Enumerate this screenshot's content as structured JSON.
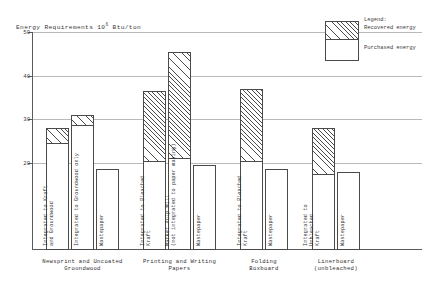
{
  "chart_data": {
    "type": "bar",
    "title_main": "Energy Requirements 10",
    "title_exponent": "6",
    "title_units": " Btu/ton",
    "xlabel": "",
    "ylabel": "",
    "ylim": [
      0,
      50
    ],
    "yticks": [
      20,
      30,
      40,
      50
    ],
    "ytick_labels": [
      "20",
      "30",
      "40",
      "50"
    ],
    "grid": true,
    "stacked": true,
    "legend": {
      "title": "Legend:",
      "position": "top-right",
      "entries": [
        {
          "name": "Recovered energy",
          "pattern": "diagonal-hatch"
        },
        {
          "name": "Purchased energy",
          "pattern": "solid-white"
        }
      ]
    },
    "series": [
      {
        "name": "Purchased energy",
        "values": [
          24.5,
          28.7,
          18.5,
          20.5,
          21.0,
          19.5,
          20.5,
          18.5,
          17.5,
          18.0
        ]
      },
      {
        "name": "Recovered energy",
        "values": [
          3.5,
          2.3,
          0.0,
          16.0,
          24.5,
          0.0,
          16.5,
          0.0,
          10.5,
          0.0
        ]
      }
    ],
    "totals": [
      28.0,
      31.0,
      18.5,
      36.5,
      45.5,
      19.5,
      37.0,
      18.5,
      28.0,
      18.0
    ],
    "categories": [
      "Integrated to Kraft\nand Groundwood",
      "Integrated to Groundwood only",
      "Wastepaper",
      "Integrated to Bleached\nKraft",
      "Market Pulp Mill\n(not integrated to paper making)",
      "Wastepaper",
      "Integrated to Bleached\nKraft",
      "Wastepaper",
      "Integrated to\nUnbleached\nKraft",
      "Wastepaper"
    ],
    "groups": [
      {
        "label": "Newsprint and Uncoated\nGroundwood",
        "bar_indices": [
          0,
          1,
          2
        ]
      },
      {
        "label": "Printing and Writing\nPapers",
        "bar_indices": [
          3,
          4,
          5
        ]
      },
      {
        "label": "Folding\nBoxboard",
        "bar_indices": [
          6,
          7
        ]
      },
      {
        "label": "Linerboard\n(unbleached)",
        "bar_indices": [
          8,
          9
        ]
      }
    ],
    "colors": {
      "axis": "#5a5a5a",
      "gridline": "#b9b9b9",
      "bar_outline": "#4a4a4a",
      "bar_fill": "#ffffff",
      "hatch": "#4a4a4a",
      "text": "#2f2f2f",
      "background": "#ffffff"
    }
  }
}
